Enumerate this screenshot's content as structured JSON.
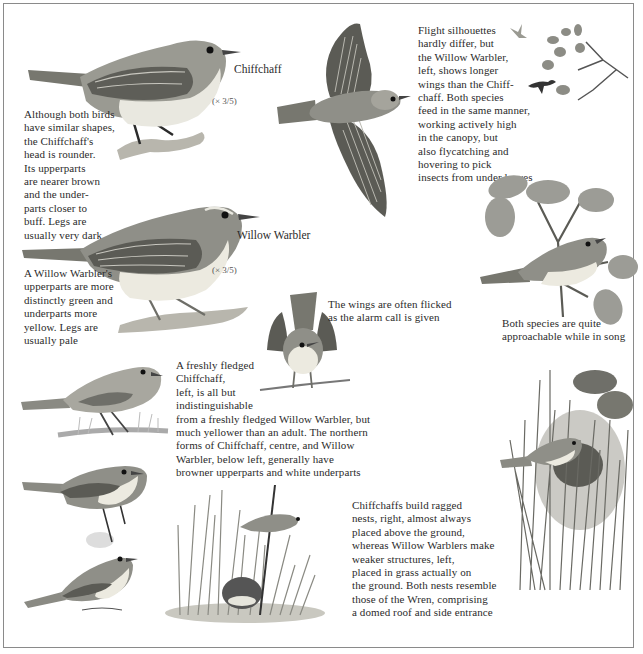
{
  "labels": {
    "chiffchaff": "Chiffchaff",
    "willow_warbler": "Willow Warbler",
    "scale_chiffchaff": "(× 3/5)",
    "scale_willow": "(× 3/5)"
  },
  "captions": {
    "shape_comparison": "Although both birds\nhave similar shapes,\nthe Chiffchaff's\nhead is rounder.\nIts upperparts\nare nearer brown\nand the under-\nparts closer to\nbuff. Legs are\nusually very dark",
    "willow_warbler_note": "A Willow Warbler's\nupperparts are more\ndistinctly green and\nunderparts more\nyellow. Legs are\nusually pale",
    "flight": "Flight silhouettes\nhardly differ, but\nthe Willow Warbler,\nleft, shows longer\nwings than the Chiff-\nchaff. Both species\nfeed in the same manner,\nworking actively high\nin the canopy, but\nalso flycatching and\nhovering to pick\ninsects from under leaves",
    "alarm": "The wings are often flicked\nas the alarm call is given",
    "song": "Both species are quite\napproachable while in song",
    "fledged": "A freshly fledged\nChiffchaff,\nleft, is all but\nindistinguishable\nfrom a freshly fledged Willow Warbler, but\nmuch yellower than an adult. The northern\nforms of Chiffchaff, centre, and Willow\nWarbler, below left, generally have\nbrowner upperparts and white underparts",
    "nests": "Chiffchaffs build ragged\nnests, right, almost always\nplaced above the ground,\nwhereas Willow Warblers make\nweaker structures, left,\nplaced in grass actually on\nthe ground. Both nests resemble\nthose of the Wren, comprising\na domed roof and side entrance"
  },
  "colors": {
    "frame": "#8a8a8a",
    "text": "#2b2b2b",
    "bird_upper": "#8f8f88",
    "bird_under": "#ecebe4",
    "wing_dark": "#5b5b55",
    "foliage": "#9c9c96"
  }
}
